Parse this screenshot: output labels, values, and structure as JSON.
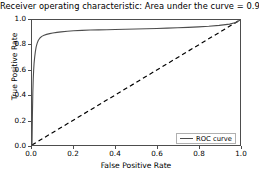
{
  "chart_data": {
    "type": "line",
    "title": "Receiver operating characteristic:    Area under the curve = 0.94",
    "title_main": "Receiver operating characteristic",
    "auc_text": "Area under the curve = 0.94",
    "auc_value": 0.94,
    "xlabel": "False Positive Rate",
    "ylabel": "True Positive Rate",
    "xlim": [
      0.0,
      1.0
    ],
    "ylim": [
      0.0,
      1.0
    ],
    "grid": false,
    "legend_position": "lower right",
    "xticks": [
      "0.0",
      "0.2",
      "0.4",
      "0.6",
      "0.8",
      "1.0"
    ],
    "xtick_values": [
      0.0,
      0.2,
      0.4,
      0.6,
      0.8,
      1.0
    ],
    "yticks": [
      "0.0",
      "0.2",
      "0.4",
      "0.6",
      "0.8",
      "1.0"
    ],
    "ytick_values": [
      0.0,
      0.2,
      0.4,
      0.6,
      0.8,
      1.0
    ],
    "series": [
      {
        "name": "ROC curve",
        "style": "solid",
        "color": "#4d4d4d",
        "x": [
          0.0,
          0.002,
          0.004,
          0.006,
          0.008,
          0.01,
          0.013,
          0.016,
          0.02,
          0.025,
          0.03,
          0.038,
          0.047,
          0.058,
          0.07,
          0.085,
          0.1,
          0.12,
          0.14,
          0.17,
          0.2,
          0.24,
          0.28,
          0.32,
          0.36,
          0.4,
          0.45,
          0.5,
          0.55,
          0.6,
          0.65,
          0.7,
          0.75,
          0.8,
          0.85,
          0.9,
          0.95,
          0.98,
          1.0
        ],
        "y": [
          0.0,
          0.24,
          0.42,
          0.53,
          0.6,
          0.655,
          0.705,
          0.745,
          0.785,
          0.815,
          0.836,
          0.856,
          0.869,
          0.878,
          0.885,
          0.891,
          0.896,
          0.901,
          0.905,
          0.91,
          0.914,
          0.917,
          0.92,
          0.921,
          0.922,
          0.924,
          0.926,
          0.928,
          0.93,
          0.932,
          0.935,
          0.938,
          0.941,
          0.945,
          0.95,
          0.957,
          0.967,
          0.98,
          1.0
        ]
      },
      {
        "name": "chance",
        "style": "dashed",
        "color": "#000000",
        "x": [
          0.0,
          1.0
        ],
        "y": [
          0.0,
          1.0
        ]
      }
    ],
    "legend": [
      {
        "label": "ROC curve",
        "color": "#4d4d4d",
        "style": "solid"
      }
    ]
  },
  "legend": {
    "roc_label": "ROC curve"
  },
  "axes": {
    "xlabel": "False Positive Rate",
    "ylabel": "True Positive Rate"
  },
  "title": {
    "full": "Receiver operating characteristic:    Area under the curve = 0.94"
  },
  "colors": {
    "curve": "#4d4d4d",
    "diagonal": "#000000",
    "frame": "#4d4d4d",
    "background": "#ffffff",
    "text": "#000000"
  }
}
